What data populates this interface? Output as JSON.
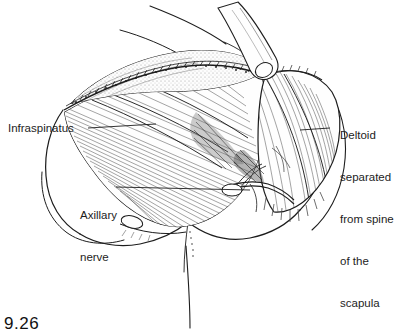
{
  "figure": {
    "number": "9.26",
    "background_color": "#ffffff",
    "ink_color": "#1d1d1d"
  },
  "labels": {
    "infraspinatus": "Infraspinatus",
    "axillary_nerve_line1": "Axillary",
    "axillary_nerve_line2": "nerve",
    "deltoid_line1": "Deltoid",
    "deltoid_line2": "separated",
    "deltoid_line3": "from spine",
    "deltoid_line4": "of the",
    "deltoid_line5": "scapula"
  },
  "structures": [
    "deltoid-flap",
    "infraspinatus-muscle",
    "infraspinatus-fascia-cut-edge",
    "axillary-nerve",
    "retractor-blade",
    "skin-contour"
  ]
}
